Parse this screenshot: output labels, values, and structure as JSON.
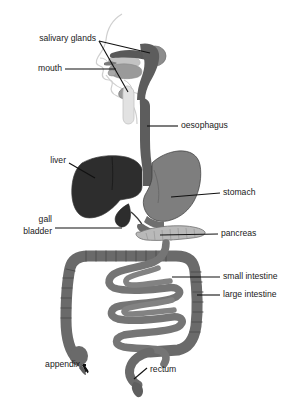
{
  "diagram": {
    "background_color": "#ffffff",
    "text_color": "#1a1a1a",
    "leader_color": "#111111"
  },
  "palette": {
    "liver": "#2d2d2d",
    "stomach": "#7e7e7e",
    "oesophagus": "#5d5d5d",
    "intestine": "#6a6a6a",
    "small_intestine": "#757575",
    "pancreas": "#b9b9b9",
    "gall_bladder": "#2d2d2d",
    "head_outline": "#cfcfcf",
    "tongue": "#9a9a9a",
    "salivary_gland": "#8c8c8c",
    "trachea": "#d8d8d8",
    "oral_cavity": "#c3c3c3"
  },
  "labels": [
    {
      "id": "salivary-glands",
      "text": "salivary glands",
      "align": "end",
      "x": 96,
      "y": 39
    },
    {
      "id": "mouth",
      "text": "mouth",
      "align": "end",
      "x": 62,
      "y": 69
    },
    {
      "id": "oesophagus",
      "text": "oesophagus",
      "align": "start",
      "x": 181,
      "y": 126
    },
    {
      "id": "liver",
      "text": "liver",
      "align": "end",
      "x": 66,
      "y": 161
    },
    {
      "id": "stomach",
      "text": "stomach",
      "align": "start",
      "x": 223,
      "y": 193
    },
    {
      "id": "gall-bladder-1",
      "text": "gall",
      "align": "end",
      "x": 52,
      "y": 220
    },
    {
      "id": "gall-bladder-2",
      "text": "bladder",
      "align": "end",
      "x": 52,
      "y": 232
    },
    {
      "id": "pancreas",
      "text": "pancreas",
      "align": "start",
      "x": 221,
      "y": 234
    },
    {
      "id": "small-intestine",
      "text": "small intestine",
      "align": "start",
      "x": 223,
      "y": 277
    },
    {
      "id": "large-intestine",
      "text": "large intestine",
      "align": "start",
      "x": 223,
      "y": 295
    },
    {
      "id": "appendix",
      "text": "appendix",
      "align": "end",
      "x": 80,
      "y": 365
    },
    {
      "id": "rectum",
      "text": "rectum",
      "align": "start",
      "x": 150,
      "y": 370
    }
  ],
  "organs": [
    {
      "id": "salivary-glands",
      "name": "salivary glands"
    },
    {
      "id": "mouth",
      "name": "mouth"
    },
    {
      "id": "oesophagus",
      "name": "oesophagus"
    },
    {
      "id": "liver",
      "name": "liver"
    },
    {
      "id": "stomach",
      "name": "stomach"
    },
    {
      "id": "gall-bladder",
      "name": "gall bladder"
    },
    {
      "id": "pancreas",
      "name": "pancreas"
    },
    {
      "id": "small-intestine",
      "name": "small intestine"
    },
    {
      "id": "large-intestine",
      "name": "large intestine"
    },
    {
      "id": "appendix",
      "name": "appendix"
    },
    {
      "id": "rectum",
      "name": "rectum"
    }
  ]
}
